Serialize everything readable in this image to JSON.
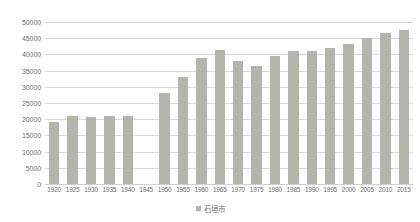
{
  "chart_data": {
    "type": "bar",
    "title": "",
    "subtitle": "",
    "xlabel": "",
    "ylabel": "",
    "ylim": [
      0,
      50000
    ],
    "ytick_step": 5000,
    "yticks": [
      "0",
      "5000",
      "10000",
      "15000",
      "20000",
      "25000",
      "30000",
      "35000",
      "40000",
      "45000",
      "50000"
    ],
    "grid": true,
    "legend_position": "bottom",
    "bar_color": "#b4b4aa",
    "gridline_color": "#d8d8d8",
    "axis_text_color": "#6e6e6e",
    "categories": [
      "1920",
      "1925",
      "1930",
      "1935",
      "1940",
      "1945",
      "1950",
      "1955",
      "1960",
      "1965",
      "1970",
      "1975",
      "1980",
      "1985",
      "1990",
      "1995",
      "2000",
      "2005",
      "2010",
      "2015"
    ],
    "series": [
      {
        "name": "石垣市",
        "values": [
          19000,
          21000,
          20700,
          20900,
          21000,
          null,
          28000,
          33000,
          39000,
          41500,
          38000,
          36500,
          39600,
          41200,
          41000,
          42000,
          43200,
          45000,
          46500,
          47500
        ]
      }
    ]
  },
  "legend": {
    "items": [
      {
        "label": "石垣市",
        "color": "#b4b4aa"
      }
    ]
  }
}
